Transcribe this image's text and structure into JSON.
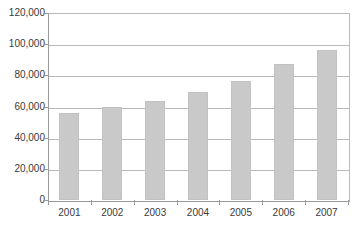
{
  "chart_data": {
    "type": "bar",
    "title": "",
    "subtitle": "",
    "xlabel": "",
    "ylabel": "",
    "categories": [
      "2001",
      "2002",
      "2003",
      "2004",
      "2005",
      "2006",
      "2007"
    ],
    "values": [
      56000,
      60000,
      63500,
      69000,
      76500,
      87500,
      96000
    ],
    "series": [
      {
        "name": "",
        "values": [
          56000,
          60000,
          63500,
          69000,
          76500,
          87500,
          96000
        ]
      }
    ],
    "ylim": [
      0,
      120000
    ],
    "ytick_values": [
      0,
      20000,
      40000,
      60000,
      80000,
      100000,
      120000
    ],
    "ytick_labels": [
      "0",
      "20,000",
      "40,000",
      "60,000",
      "80,000",
      "100,000",
      "120,000"
    ],
    "grid": "horizontal",
    "legend": "none",
    "bar_color": "#c9c9c9",
    "gridline_color": "#b9b9b9",
    "axis_color": "#9a9a9a",
    "background_color": "#ffffff",
    "text_color": "#3a3a3a",
    "annotations": []
  }
}
